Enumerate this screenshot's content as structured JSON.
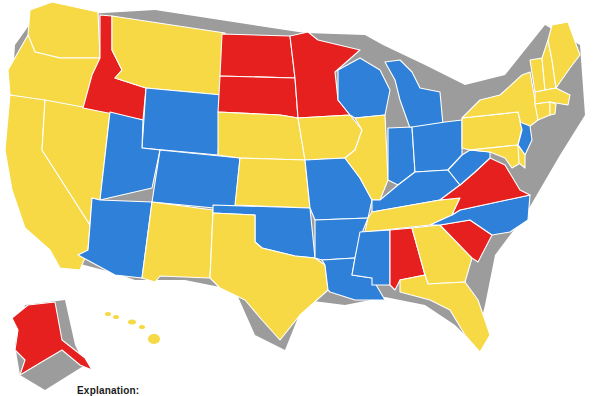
{
  "map": {
    "type": "choropleth",
    "region": "United States",
    "colors": {
      "yellow": "#F6D945",
      "blue": "#2F80D8",
      "red": "#E5201E",
      "shadow": "#9c9c9c",
      "border": "#ffffff"
    },
    "legend": {
      "title": "Explanation:"
    },
    "states": {
      "WA": "yellow",
      "OR": "yellow",
      "CA": "yellow",
      "NV": "yellow",
      "ID": "red",
      "MT": "yellow",
      "WY": "blue",
      "UT": "blue",
      "CO": "blue",
      "AZ": "blue",
      "NM": "yellow",
      "ND": "red",
      "SD": "red",
      "NE": "yellow",
      "KS": "yellow",
      "OK": "blue",
      "TX": "yellow",
      "MN": "red",
      "IA": "yellow",
      "MO": "blue",
      "AR": "blue",
      "LA": "blue",
      "WI": "blue",
      "IL": "yellow",
      "MI": "blue",
      "IN": "blue",
      "OH": "blue",
      "KY": "blue",
      "TN": "yellow",
      "MS": "blue",
      "AL": "red",
      "GA": "yellow",
      "FL": "yellow",
      "SC": "red",
      "NC": "blue",
      "VA": "red",
      "WV": "blue",
      "PA": "yellow",
      "NY": "yellow",
      "NJ": "blue",
      "DE": "yellow",
      "MD": "yellow",
      "CT": "yellow",
      "RI": "yellow",
      "MA": "yellow",
      "VT": "yellow",
      "NH": "yellow",
      "ME": "yellow",
      "AK": "red",
      "HI": "yellow"
    }
  }
}
